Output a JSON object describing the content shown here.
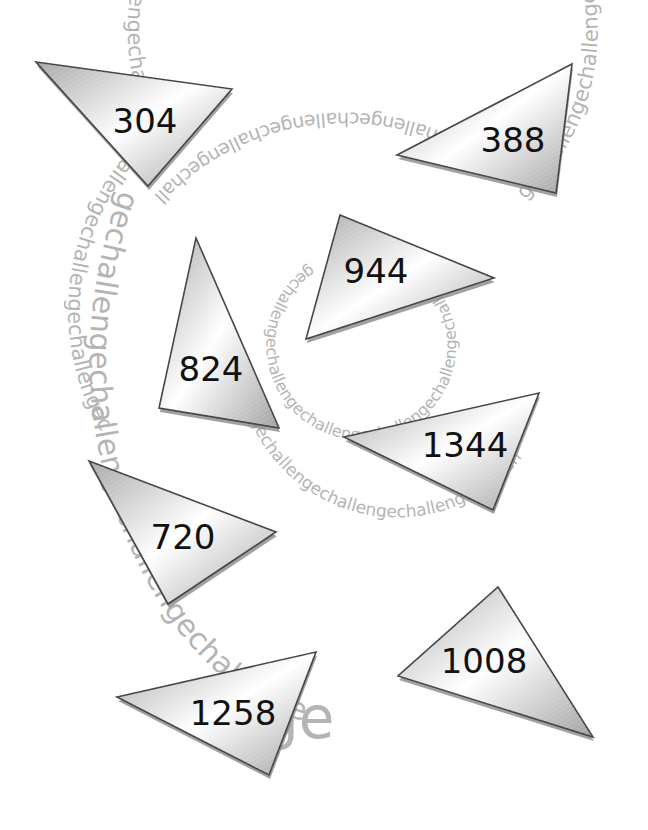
{
  "background": {
    "watermark_word": "challenge",
    "watermark_repeated": "gechallengechallengechallengechallengechallengechallengechallengechallengechallengechallengechallengechallengechallengechallengechallenge",
    "watermark_color": "#b4b4b4",
    "final_fragment": "ge"
  },
  "style": {
    "triangle_fill_light": "#ffffff",
    "triangle_fill_dark": "#a9a9a9",
    "triangle_stroke": "#444444",
    "label_color": "#111111"
  },
  "triangles": [
    {
      "label": "304",
      "points": [
        [
          36,
          62
        ],
        [
          232,
          89
        ],
        [
          148,
          186
        ]
      ],
      "text_pos": [
        145,
        123
      ]
    },
    {
      "label": "388",
      "points": [
        [
          397,
          155
        ],
        [
          572,
          64
        ],
        [
          556,
          193
        ]
      ],
      "text_pos": [
        513,
        142
      ]
    },
    {
      "label": "824",
      "points": [
        [
          196,
          238
        ],
        [
          159,
          408
        ],
        [
          279,
          428
        ]
      ],
      "text_pos": [
        211,
        371
      ]
    },
    {
      "label": "944",
      "points": [
        [
          340,
          215
        ],
        [
          494,
          278
        ],
        [
          306,
          339
        ]
      ],
      "text_pos": [
        376,
        273
      ]
    },
    {
      "label": "1344",
      "points": [
        [
          344,
          437
        ],
        [
          539,
          393
        ],
        [
          493,
          510
        ]
      ],
      "text_pos": [
        465,
        447
      ]
    },
    {
      "label": "720",
      "points": [
        [
          89,
          461
        ],
        [
          276,
          532
        ],
        [
          168,
          604
        ]
      ],
      "text_pos": [
        183,
        539
      ]
    },
    {
      "label": "1258",
      "points": [
        [
          117,
          697
        ],
        [
          316,
          652
        ],
        [
          269,
          775
        ]
      ],
      "text_pos": [
        233,
        715
      ]
    },
    {
      "label": "1008",
      "points": [
        [
          498,
          587
        ],
        [
          593,
          737
        ],
        [
          398,
          676
        ]
      ],
      "text_pos": [
        484,
        663
      ]
    }
  ]
}
